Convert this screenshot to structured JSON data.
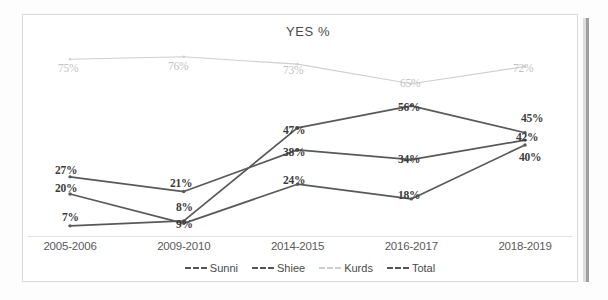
{
  "chart_data": {
    "type": "line",
    "title": "YES %",
    "xlabel": "",
    "ylabel": "",
    "ylim": [
      0,
      80
    ],
    "grid": false,
    "legend_position": "bottom",
    "categories": [
      "2005-2006",
      "2009-2010",
      "2014-2015",
      "2016-2017",
      "2018-2019"
    ],
    "series": [
      {
        "name": "Sunni",
        "color": "#595959",
        "values": [
          7,
          9,
          47,
          56,
          45
        ],
        "labels": [
          "7%",
          "9%",
          "47%",
          "56%",
          "45%"
        ]
      },
      {
        "name": "Shiee",
        "color": "#595959",
        "values": [
          27,
          21,
          38,
          34,
          42
        ],
        "labels": [
          "27%",
          "21%",
          "38%",
          "34%",
          "42%"
        ]
      },
      {
        "name": "Kurds",
        "color": "#cfcfcf",
        "values": [
          75,
          76,
          73,
          65,
          72
        ],
        "labels": [
          "75%",
          "76%",
          "73%",
          "65%",
          "72%"
        ]
      },
      {
        "name": "Total",
        "color": "#595959",
        "values": [
          20,
          8,
          24,
          18,
          40
        ],
        "labels": [
          "20%",
          "8%",
          "24%",
          "18%",
          "40%"
        ]
      }
    ]
  },
  "chart": {
    "title": "YES %"
  },
  "xaxis": {
    "ticks": [
      {
        "label": "2005-2006"
      },
      {
        "label": "2009-2010"
      },
      {
        "label": "2014-2015"
      },
      {
        "label": "2016-2017"
      },
      {
        "label": "2018-2019"
      }
    ]
  },
  "legend": {
    "items": [
      {
        "label": "Sunni",
        "color": "#555555"
      },
      {
        "label": "Shiee",
        "color": "#555555"
      },
      {
        "label": "Kurds",
        "color": "#cfcfcf"
      },
      {
        "label": "Total",
        "color": "#555555"
      }
    ]
  },
  "point_labels": [
    {
      "text": "75%",
      "x": 58,
      "y": 62,
      "faint": true
    },
    {
      "text": "76%",
      "x": 168,
      "y": 60,
      "faint": true
    },
    {
      "text": "73%",
      "x": 283,
      "y": 64,
      "faint": true
    },
    {
      "text": "65%",
      "x": 400,
      "y": 77,
      "faint": true
    },
    {
      "text": "72%",
      "x": 513,
      "y": 62,
      "faint": true
    },
    {
      "text": "27%",
      "x": 55,
      "y": 164,
      "faint": false
    },
    {
      "text": "20%",
      "x": 55,
      "y": 182,
      "faint": false
    },
    {
      "text": "7%",
      "x": 62,
      "y": 211,
      "faint": false
    },
    {
      "text": "21%",
      "x": 170,
      "y": 177,
      "faint": false
    },
    {
      "text": "8%",
      "x": 176,
      "y": 201,
      "faint": false
    },
    {
      "text": "9%",
      "x": 176,
      "y": 218,
      "faint": false
    },
    {
      "text": "47%",
      "x": 283,
      "y": 124,
      "faint": false
    },
    {
      "text": "38%",
      "x": 283,
      "y": 146,
      "faint": false
    },
    {
      "text": "24%",
      "x": 283,
      "y": 174,
      "faint": false
    },
    {
      "text": "56%",
      "x": 398,
      "y": 101,
      "faint": false
    },
    {
      "text": "34%",
      "x": 398,
      "y": 153,
      "faint": false
    },
    {
      "text": "18%",
      "x": 398,
      "y": 189,
      "faint": false
    },
    {
      "text": "45%",
      "x": 521,
      "y": 112,
      "faint": false
    },
    {
      "text": "42%",
      "x": 516,
      "y": 131,
      "faint": false
    },
    {
      "text": "40%",
      "x": 519,
      "y": 151,
      "faint": false
    }
  ]
}
